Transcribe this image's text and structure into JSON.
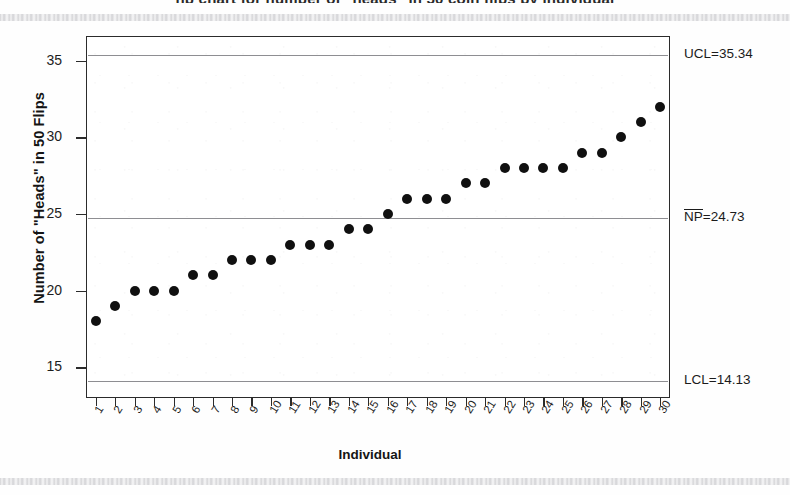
{
  "page": {
    "clipped_title_text": "np chart for number of \"heads\" in 50 coin flips by individual",
    "x_axis_title": "Individual",
    "y_axis_title": "Number of \"Heads\" in 50 Flips"
  },
  "annotations": {
    "ucl": {
      "label": "UCL=35.34",
      "value": 35.34
    },
    "center": {
      "label_prefix": "NP",
      "label_suffix": "=24.73",
      "value": 24.73
    },
    "lcl": {
      "label": "LCL=14.13",
      "value": 14.13
    }
  },
  "colors": {
    "point": "#101010",
    "frame": "#2b2b2b",
    "limit_line": "#8e8e92",
    "background": "#ffffff",
    "text": "#1a1a1a"
  },
  "chart_data": {
    "type": "scatter",
    "title": "",
    "xlabel": "Individual",
    "ylabel": "Number of \"Heads\" in 50 Flips",
    "xlim": [
      0.5,
      30.5
    ],
    "ylim": [
      13.0,
      36.6
    ],
    "grid": false,
    "legend": "none",
    "y_ticks": [
      15,
      20,
      25,
      30,
      35
    ],
    "x_ticks": [
      1,
      2,
      3,
      4,
      5,
      6,
      7,
      8,
      9,
      10,
      11,
      12,
      13,
      14,
      15,
      16,
      17,
      18,
      19,
      20,
      21,
      22,
      23,
      24,
      25,
      26,
      27,
      28,
      29,
      30
    ],
    "x_tick_labels": [
      "1",
      "2",
      "3",
      "4",
      "5",
      "6",
      "7",
      "8",
      "9",
      "10",
      "11",
      "12",
      "13",
      "14",
      "15",
      "16",
      "17",
      "18",
      "19",
      "20",
      "21",
      "22",
      "23",
      "24",
      "25",
      "26",
      "27",
      "28",
      "29",
      "30"
    ],
    "categories": [
      1,
      2,
      3,
      4,
      5,
      6,
      7,
      8,
      9,
      10,
      11,
      12,
      13,
      14,
      15,
      16,
      17,
      18,
      19,
      20,
      21,
      22,
      23,
      24,
      25,
      26,
      27,
      28,
      29,
      30
    ],
    "values": [
      18,
      19,
      20,
      20,
      20,
      21,
      21,
      22,
      22,
      22,
      23,
      23,
      23,
      24,
      24,
      25,
      26,
      26,
      26,
      27,
      27,
      28,
      28,
      28,
      28,
      29,
      29,
      30,
      31,
      32
    ],
    "series": [
      {
        "name": "Number of \"Heads\" in 50 Flips",
        "values": [
          18,
          19,
          20,
          20,
          20,
          21,
          21,
          22,
          22,
          22,
          23,
          23,
          23,
          24,
          24,
          25,
          26,
          26,
          26,
          27,
          27,
          28,
          28,
          28,
          28,
          29,
          29,
          30,
          31,
          32
        ]
      }
    ],
    "reference_lines": [
      {
        "name": "UCL",
        "value": 35.34,
        "label": "UCL=35.34"
      },
      {
        "name": "NP-bar",
        "value": 24.73,
        "label": "NP=24.73"
      },
      {
        "name": "LCL",
        "value": 14.13,
        "label": "LCL=14.13"
      }
    ]
  }
}
